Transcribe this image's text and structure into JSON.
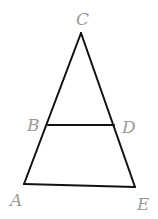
{
  "diagram": {
    "type": "triangle-with-parallel-segment",
    "points": {
      "A": {
        "label": "A",
        "x": 24,
        "y": 184
      },
      "B": {
        "label": "B",
        "x": 48,
        "y": 125
      },
      "C": {
        "label": "C",
        "x": 81,
        "y": 33
      },
      "D": {
        "label": "D",
        "x": 114,
        "y": 125
      },
      "E": {
        "label": "E",
        "x": 135,
        "y": 187
      }
    },
    "segments": [
      "CA",
      "CE",
      "AE",
      "BD"
    ],
    "colors": {
      "line": "#111111",
      "label": "#9a9a9a"
    }
  }
}
